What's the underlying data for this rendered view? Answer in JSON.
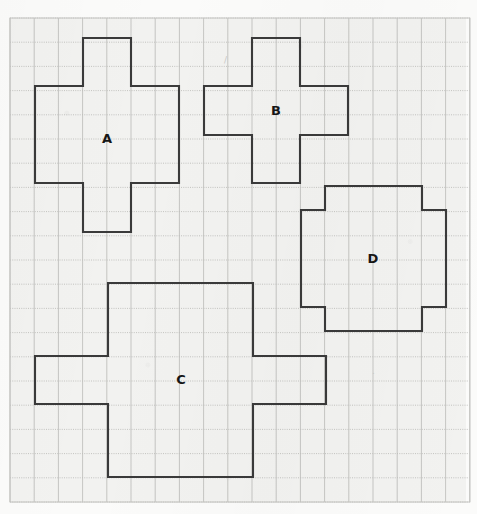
{
  "meta": {
    "canvas": {
      "width": 477,
      "height": 514
    },
    "background_color": "#fbfbfa",
    "paper_color": "#f2f2f0"
  },
  "grid": {
    "origin_x": 10,
    "origin_y": 18,
    "cell_size": 24.2,
    "cols": 19,
    "rows": 20,
    "vertical_line_color": "#b9b9b6",
    "horizontal_line_color": "#bdbdba",
    "horizontal_line_style": "dotted",
    "vertical_line_style": "solid",
    "border_color": "#c6c6c3"
  },
  "shapes": [
    {
      "id": "A",
      "label": "A",
      "type": "plus",
      "stroke_color": "#3a3a3a",
      "stroke_width": 2.1,
      "label_x": 107,
      "label_y": 139,
      "points": "83,38 131,38 131,86 179,86 179,183 131,183 131,232 83,232 83,183 35,183 35,86 83,86"
    },
    {
      "id": "B",
      "label": "B",
      "type": "plus",
      "stroke_color": "#3a3a3a",
      "stroke_width": 2.1,
      "label_x": 276,
      "label_y": 111,
      "points": "252,38 300,38 300,86 348,86 348,135 300,135 300,183 252,183 252,135 204,135 204,86 252,86"
    },
    {
      "id": "C",
      "label": "C",
      "type": "cross-wide",
      "stroke_color": "#3a3a3a",
      "stroke_width": 2.1,
      "label_x": 181,
      "label_y": 380,
      "points": "108,283 253,283 253,356 326,356 326,404 253,404 253,477 108,477 108,404 35,404 35,356 108,356"
    },
    {
      "id": "D",
      "label": "D",
      "type": "notched-square",
      "stroke_color": "#3a3a3a",
      "stroke_width": 2.1,
      "label_x": 373,
      "label_y": 259,
      "points": "325,186 422,186 422,210 446,210 446,307 422,307 422,331 325,331 325,307 301,307 301,210 325,210"
    }
  ],
  "annotations": {
    "stray_mark_1": {
      "x": 224,
      "y": 63,
      "text": "/"
    },
    "stray_mark_2": {
      "x": 372,
      "y": 374,
      "text": "."
    }
  }
}
